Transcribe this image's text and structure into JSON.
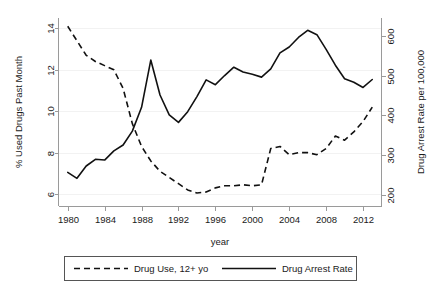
{
  "chart_data": {
    "type": "line",
    "title": "",
    "xlabel": "year",
    "ylabel": "% Used Drugs Past Month",
    "y2label": "Drug Arrest Rate per 100,000",
    "xlim": [
      1979,
      2014
    ],
    "ylim": [
      5.4,
      14.5
    ],
    "y2lim": [
      170,
      645
    ],
    "xticks": [
      1980,
      1984,
      1988,
      1992,
      1996,
      2000,
      2004,
      2008,
      2012
    ],
    "yticks": [
      6,
      8,
      10,
      12,
      14
    ],
    "y2ticks": [
      200,
      300,
      400,
      500,
      600
    ],
    "grid": false,
    "legend_position": "bottom",
    "x": [
      1980,
      1981,
      1982,
      1983,
      1984,
      1985,
      1986,
      1987,
      1988,
      1989,
      1990,
      1991,
      1992,
      1993,
      1994,
      1995,
      1996,
      1997,
      1998,
      1999,
      2000,
      2001,
      2002,
      2003,
      2004,
      2005,
      2006,
      2007,
      2008,
      2009,
      2010,
      2011,
      2012,
      2013
    ],
    "series": [
      {
        "name": "Drug Use, 12+ yo",
        "axis": "left",
        "style": "dashed",
        "unit": "% Used Drugs Past Month",
        "values": [
          14.1,
          13.4,
          12.7,
          12.4,
          12.2,
          12.0,
          11.1,
          9.4,
          8.3,
          7.6,
          7.1,
          6.8,
          6.5,
          6.2,
          6.05,
          6.1,
          6.3,
          6.4,
          6.4,
          6.45,
          6.4,
          6.45,
          8.2,
          8.3,
          7.9,
          8.0,
          8.0,
          7.9,
          8.2,
          8.8,
          8.6,
          9.0,
          9.5,
          10.2
        ]
      },
      {
        "name": "Drug Arrest Rate",
        "axis": "right",
        "style": "solid",
        "unit": "Drug Arrest Rate per 100,000",
        "values": [
          256,
          241,
          272,
          289,
          287,
          310,
          325,
          360,
          420,
          539,
          451,
          401,
          382,
          409,
          447,
          489,
          477,
          500,
          521,
          509,
          503,
          496,
          517,
          557,
          572,
          596,
          614,
          603,
          566,
          526,
          492,
          483,
          470,
          490
        ]
      }
    ]
  },
  "legend": {
    "entries": [
      {
        "label": "Drug Use, 12+ yo",
        "style": "dashed"
      },
      {
        "label": "Drug Arrest Rate",
        "style": "solid"
      }
    ]
  },
  "axes": {
    "left_title": "% Used Drugs Past Month",
    "right_title": "Drug Arrest Rate per 100,000",
    "bottom_title": "year",
    "left_tick_labels": [
      "6",
      "8",
      "10",
      "12",
      "14"
    ],
    "right_tick_labels": [
      "200",
      "300",
      "400",
      "500",
      "600"
    ],
    "bottom_tick_labels": [
      "1980",
      "1984",
      "1988",
      "1992",
      "1996",
      "2000",
      "2004",
      "2008",
      "2012"
    ]
  },
  "colors": {
    "series_stroke": "#111111",
    "axis": "#9a9a9a",
    "background": "#ffffff",
    "legend_border": "#555555"
  }
}
